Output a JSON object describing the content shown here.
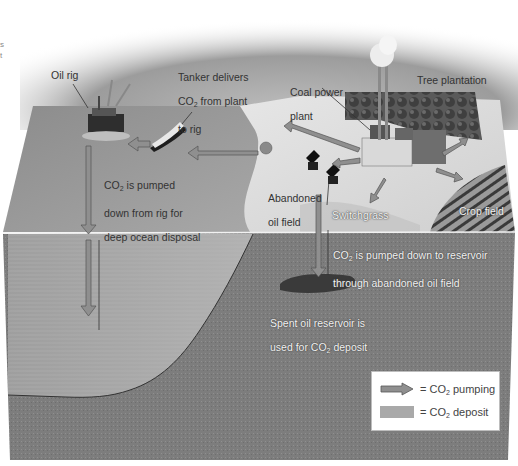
{
  "figure": {
    "colors": {
      "sky_top": "#8e8e8e",
      "ocean_surface": "#9a9a9a",
      "land_surface": "#d6d6d6",
      "bedrock": "#7a7a7a",
      "ocean_section": "#a4a4a4",
      "arrow_fill": "#8f8f8f",
      "arrow_stroke": "#555555",
      "legend_bg": "#ffffff"
    }
  },
  "labels": {
    "oil_rig": "Oil rig",
    "tanker": {
      "line1": "Tanker delivers",
      "line2_prefix": "CO",
      "line2_sub": "2",
      "line2_suffix": " from plant",
      "line3": "to rig"
    },
    "coal_plant": {
      "line1": "Coal power",
      "line2": "plant"
    },
    "tree_plantation": "Tree plantation",
    "ocean_disposal": {
      "line1_prefix": "CO",
      "line1_sub": "2",
      "line1_suffix": " is pumped",
      "line2": "down from rig for",
      "line3": "deep ocean disposal"
    },
    "abandoned_field": {
      "line1": "Abandoned",
      "line2": "oil field"
    },
    "switchgrass": "Switchgrass",
    "crop_field": "Crop field",
    "reservoir_pump": {
      "line1_prefix": "CO",
      "line1_sub": "2",
      "line1_suffix": " is pumped down to reservoir",
      "line2": "through abandoned oil field"
    },
    "spent_reservoir": {
      "line1": "Spent oil reservoir is",
      "line2_prefix": "used for CO",
      "line2_sub": "2",
      "line2_suffix": " deposit"
    },
    "edge_fragment": {
      "line1": "s",
      "line2": "t"
    }
  },
  "legend": {
    "items": [
      {
        "icon": "arrow-icon",
        "prefix": "= CO",
        "sub": "2",
        "suffix": " pumping"
      },
      {
        "icon": "deposit-swatch",
        "prefix": "= CO",
        "sub": "2",
        "suffix": " deposit"
      }
    ]
  }
}
